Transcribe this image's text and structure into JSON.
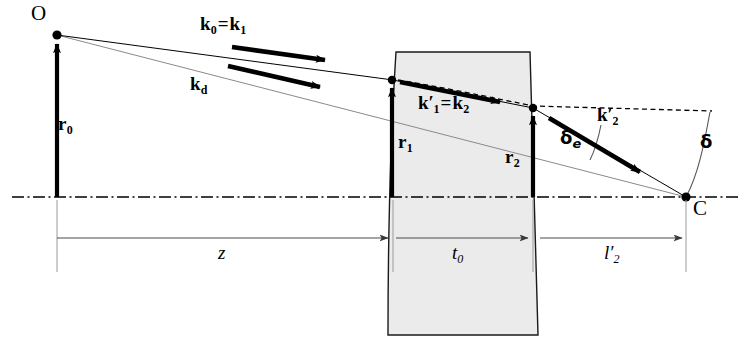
{
  "figure": {
    "type": "optical-ray-diagram",
    "background_color": "#ffffff",
    "line_color": "#000000",
    "glass_fill_color": "#ebebeb",
    "glass_edge_color": "#1a1a1a",
    "thin_ray_color": "#777777"
  },
  "points": [
    {
      "id": "O",
      "label": "O",
      "x": 57,
      "y": 35,
      "label_x": 33,
      "label_y": 8
    },
    {
      "id": "C",
      "label": "C",
      "x": 686,
      "y": 197,
      "label_x": 693,
      "label_y": 197
    },
    {
      "id": "P1",
      "label": "",
      "x": 392,
      "y": 80
    },
    {
      "id": "P2",
      "label": "",
      "x": 533,
      "y": 108
    }
  ],
  "vector_labels": [
    {
      "id": "k0k1",
      "base": "k",
      "sub": "0",
      "eq": "=",
      "base2": "k",
      "sub2": "1",
      "x": 212,
      "y": 25
    },
    {
      "id": "kd",
      "base": "k",
      "sub": "d",
      "x": 196,
      "y": 84
    },
    {
      "id": "k1pk2",
      "base": "k",
      "prime": "′",
      "sub": "1",
      "eq": "=",
      "base2": "k",
      "sub2": "2",
      "x": 433,
      "y": 104
    },
    {
      "id": "k2p",
      "base": "k",
      "prime": "′",
      "sub": "2",
      "x": 605,
      "y": 116
    },
    {
      "id": "r0",
      "base": "r",
      "sub": "0",
      "x": 64,
      "y": 125
    },
    {
      "id": "r1",
      "base": "r",
      "sub": "1",
      "x": 403,
      "y": 143
    },
    {
      "id": "r2",
      "base": "r",
      "sub": "2",
      "x": 540,
      "y": 158
    }
  ],
  "scalar_labels": [
    {
      "id": "z",
      "text": "z",
      "sub": "",
      "x": 223,
      "y": 253
    },
    {
      "id": "t0",
      "text": "t",
      "sub": "0",
      "x": 458,
      "y": 253
    },
    {
      "id": "l2p",
      "text": "l′",
      "sub": "2",
      "x": 611,
      "y": 253
    }
  ],
  "angle_labels": [
    {
      "id": "delta_e",
      "glyph": "δ",
      "sub": "e",
      "x": 570,
      "y": 139
    },
    {
      "id": "delta",
      "glyph": "δ",
      "sub": "",
      "x": 702,
      "y": 143
    }
  ],
  "geometry": {
    "optical_axis_y": 197,
    "optical_axis_x_start": 12,
    "optical_axis_x_end": 740,
    "lens": {
      "top_y": 52,
      "bottom_y": 335,
      "left_top_x": 396,
      "left_bottom_x": 388,
      "right_top_x": 530,
      "right_bottom_x": 538,
      "left_bulge": 6,
      "right_bulge": 6
    },
    "dimension_line_y": 238,
    "tick_x_positions": [
      57,
      392,
      533,
      686
    ],
    "tick_top_y": 200,
    "tick_bottom_y": 272
  },
  "rays": {
    "upper_ray": {
      "from_x": 57,
      "from_y": 35,
      "to_x": 392,
      "to_y": 80
    },
    "inner_ray": {
      "from_x": 392,
      "from_y": 80,
      "to_x": 533,
      "to_y": 108
    },
    "exit_ray": {
      "from_x": 533,
      "from_y": 108,
      "to_x": 686,
      "to_y": 197
    },
    "chief_ray": {
      "from_x": 57,
      "from_y": 35,
      "to_x": 686,
      "to_y": 197
    },
    "dashed_extension": {
      "from_x": 460,
      "from_y": 90,
      "to_x": 712,
      "to_y": 112
    }
  },
  "arrow_vectors": [
    {
      "id": "k0k1-arrow",
      "x1": 232,
      "y1": 47,
      "x2": 330,
      "y2": 61
    },
    {
      "id": "kd-arrow",
      "x1": 228,
      "y1": 66,
      "x2": 325,
      "y2": 88
    },
    {
      "id": "k1pk2-arrow",
      "x1": 400,
      "y1": 82,
      "x2": 505,
      "y2": 103
    },
    {
      "id": "k2p-arrow",
      "x1": 549,
      "y1": 119,
      "x2": 645,
      "y2": 176
    },
    {
      "id": "r0-arrow",
      "x1": 57,
      "y1": 197,
      "x2": 57,
      "y2": 40
    },
    {
      "id": "r1-arrow",
      "x1": 392,
      "y1": 197,
      "x2": 392,
      "y2": 84
    },
    {
      "id": "r2-arrow",
      "x1": 533,
      "y1": 197,
      "x2": 533,
      "y2": 112
    }
  ]
}
